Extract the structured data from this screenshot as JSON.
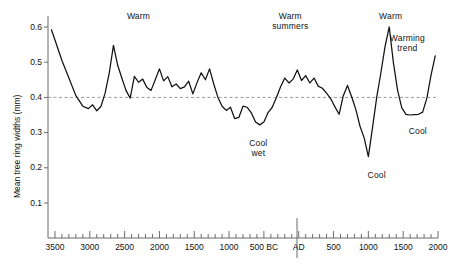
{
  "chart_data": {
    "type": "line",
    "title": "",
    "xlabel": "",
    "ylabel": "Mean tree ring widths (mm)",
    "ylim": [
      0,
      0.65
    ],
    "xlim": [
      -3600,
      2000
    ],
    "grid": false,
    "legend": null,
    "reference_line": {
      "value": 0.4,
      "style": "dashed",
      "color": "#9a9a9a"
    },
    "y_ticks": [
      "0.1",
      "0.2",
      "0.3",
      "0.4",
      "0.5",
      "0.6"
    ],
    "y_tick_values": [
      0.1,
      0.2,
      0.3,
      0.4,
      0.5,
      0.6
    ],
    "x_tick_labels": [
      "3500",
      "3000",
      "2500",
      "2000",
      "1500",
      "1000",
      "500 BC",
      "AD",
      "500",
      "1000",
      "1500",
      "2000"
    ],
    "x_tick_values": [
      -3500,
      -3000,
      -2500,
      -2000,
      -1500,
      -1000,
      -500,
      0,
      500,
      1000,
      1500,
      2000
    ],
    "x_minor_step": 100,
    "era_divider": 0,
    "line_color": "#111111",
    "series": [
      {
        "name": "Mean tree ring width",
        "x": [
          -3550,
          -3400,
          -3300,
          -3200,
          -3100,
          -3020,
          -2960,
          -2900,
          -2840,
          -2780,
          -2720,
          -2660,
          -2600,
          -2540,
          -2480,
          -2420,
          -2360,
          -2300,
          -2240,
          -2180,
          -2120,
          -2060,
          -2000,
          -1940,
          -1880,
          -1820,
          -1760,
          -1700,
          -1640,
          -1580,
          -1520,
          -1460,
          -1400,
          -1340,
          -1280,
          -1220,
          -1160,
          -1100,
          -1040,
          -980,
          -920,
          -860,
          -800,
          -740,
          -680,
          -620,
          -560,
          -500,
          -440,
          -380,
          -320,
          -260,
          -200,
          -140,
          -80,
          -20,
          40,
          100,
          160,
          220,
          280,
          340,
          400,
          460,
          520,
          580,
          640,
          700,
          760,
          820,
          880,
          940,
          1000,
          1060,
          1120,
          1180,
          1240,
          1300,
          1360,
          1420,
          1480,
          1540,
          1600,
          1660,
          1720,
          1780,
          1840,
          1900,
          1960
        ],
        "y": [
          0.592,
          0.505,
          0.455,
          0.405,
          0.375,
          0.368,
          0.379,
          0.362,
          0.374,
          0.412,
          0.47,
          0.548,
          0.492,
          0.455,
          0.42,
          0.398,
          0.46,
          0.443,
          0.452,
          0.428,
          0.42,
          0.45,
          0.481,
          0.447,
          0.459,
          0.43,
          0.438,
          0.425,
          0.43,
          0.446,
          0.41,
          0.442,
          0.47,
          0.45,
          0.481,
          0.438,
          0.4,
          0.375,
          0.363,
          0.372,
          0.34,
          0.343,
          0.375,
          0.372,
          0.356,
          0.33,
          0.322,
          0.33,
          0.357,
          0.372,
          0.4,
          0.43,
          0.455,
          0.441,
          0.452,
          0.478,
          0.448,
          0.462,
          0.441,
          0.455,
          0.432,
          0.426,
          0.412,
          0.396,
          0.373,
          0.352,
          0.405,
          0.434,
          0.402,
          0.366,
          0.318,
          0.285,
          0.232,
          0.315,
          0.4,
          0.47,
          0.545,
          0.6,
          0.498,
          0.42,
          0.37,
          0.352,
          0.35,
          0.351,
          0.352,
          0.358,
          0.398,
          0.463,
          0.518
        ]
      }
    ],
    "annotations": [
      {
        "text": "Warm",
        "x": -2300,
        "y": 0.628,
        "align": "center"
      },
      {
        "text": "Warm\nsummers",
        "x": -120,
        "y": 0.628,
        "align": "center"
      },
      {
        "text": "Warm",
        "x": 1320,
        "y": 0.628,
        "align": "center"
      },
      {
        "text": "Warming\ntrend",
        "x": 1560,
        "y": 0.565,
        "align": "center"
      },
      {
        "text": "Cool\nwet",
        "x": -580,
        "y": 0.268,
        "align": "center"
      },
      {
        "text": "Cool",
        "x": 1120,
        "y": 0.178,
        "align": "center"
      },
      {
        "text": "Cool",
        "x": 1710,
        "y": 0.303,
        "align": "center"
      }
    ]
  },
  "annotation_labels": {
    "warm_1": "Warm",
    "warm_summers_line1": "Warm",
    "warm_summers_line2": "summers",
    "warm_2": "Warm",
    "warming_trend_line1": "Warming",
    "warming_trend_line2": "trend",
    "cool_wet_line1": "Cool",
    "cool_wet_line2": "wet",
    "cool_1": "Cool",
    "cool_2": "Cool"
  }
}
